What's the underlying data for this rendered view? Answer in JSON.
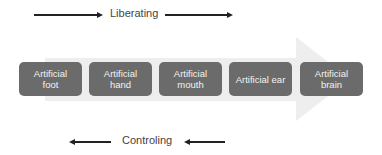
{
  "top": {
    "label": "Liberating",
    "direction": "right"
  },
  "bottom": {
    "label": "Controling",
    "direction": "left"
  },
  "big_arrow": {
    "color": "#eeeeee",
    "direction": "right"
  },
  "boxes": [
    {
      "line1": "Artificial",
      "line2": "foot"
    },
    {
      "line1": "Artificial",
      "line2": "hand"
    },
    {
      "line1": "Artificial",
      "line2": "mouth"
    },
    {
      "line1": "Artificial ear",
      "line2": ""
    },
    {
      "line1": "Artificial",
      "line2": "brain"
    }
  ],
  "colors": {
    "box": "#6b6b6b",
    "box_text": "#f2f2f2",
    "arrow": "#222222"
  }
}
